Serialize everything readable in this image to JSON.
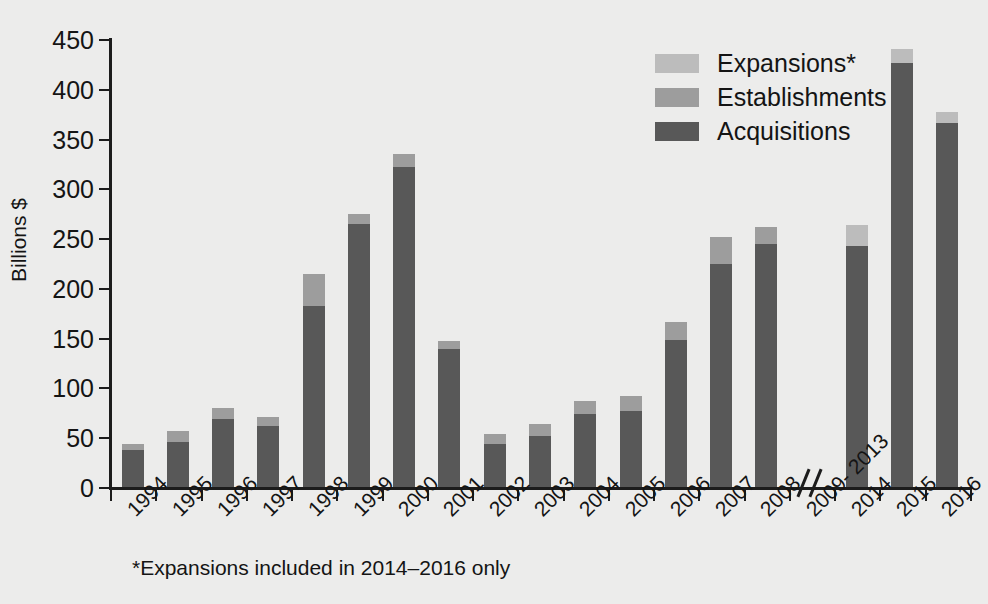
{
  "chart_data": {
    "type": "bar",
    "subtype": "stacked-bar",
    "title": "",
    "xlabel": "",
    "ylabel": "Billions $",
    "ylim": [
      0,
      450
    ],
    "ytick_step": 50,
    "yticks": [
      0,
      50,
      100,
      150,
      200,
      250,
      300,
      350,
      400,
      450
    ],
    "ytick_labels": [
      "0",
      "50",
      "100",
      "150",
      "200",
      "250",
      "300",
      "350",
      "400",
      "450"
    ],
    "grid": false,
    "legend_position": "top-right",
    "axis_break": {
      "present": true,
      "symbol": "//",
      "between": [
        "2008",
        "2014"
      ],
      "label": "2009-2013"
    },
    "footnote": "*Expansions included in 2014–2016 only",
    "categories": [
      "1994",
      "1995",
      "1996",
      "1997",
      "1998",
      "1999",
      "2000",
      "2001",
      "2002",
      "2003",
      "2004",
      "2005",
      "2006",
      "2007",
      "2008",
      "2009- 2013",
      "2014",
      "2015",
      "2016"
    ],
    "series": [
      {
        "name": "Acquisitions",
        "color": "#585858",
        "values": [
          38,
          46,
          69,
          62,
          183,
          265,
          322,
          140,
          44,
          52,
          74,
          77,
          149,
          225,
          245,
          null,
          243,
          427,
          367
        ]
      },
      {
        "name": "Establishments",
        "color": "#9d9d9d",
        "values": [
          6,
          11,
          11,
          9,
          32,
          10,
          14,
          8,
          10,
          12,
          13,
          15,
          18,
          27,
          17,
          null,
          0,
          0,
          0
        ]
      },
      {
        "name": "Expansions*",
        "color": "#bcbcbc",
        "values": [
          0,
          0,
          0,
          0,
          0,
          0,
          0,
          0,
          0,
          0,
          0,
          0,
          0,
          0,
          0,
          null,
          21,
          14,
          11
        ]
      }
    ],
    "totals": [
      44,
      57,
      80,
      71,
      215,
      275,
      336,
      148,
      54,
      64,
      87,
      92,
      167,
      252,
      262,
      null,
      264,
      441,
      378
    ]
  },
  "legend": {
    "entries": [
      {
        "label": "Expansions*",
        "color": "#bcbcbc"
      },
      {
        "label": "Establishments",
        "color": "#9d9d9d"
      },
      {
        "label": "Acquisitions",
        "color": "#585858"
      }
    ]
  },
  "colors": {
    "background": "#ececeb",
    "axis": "#1c1c1c",
    "text": "#141414",
    "acquisitions": "#585858",
    "establishments": "#9d9d9d",
    "expansions": "#bcbcbc"
  }
}
